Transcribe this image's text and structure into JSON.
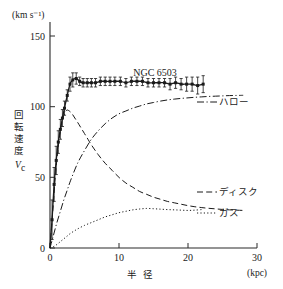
{
  "figure": {
    "name": "galaxy-rotation-curve",
    "background_color": "#ffffff",
    "ink_color": "#1a1a1a"
  },
  "labels": {
    "y_unit": "(km s⁻¹)",
    "x_unit": "(kpc)",
    "x_axis_title": "半 径",
    "y_axis_title_vertical": [
      "回",
      "転",
      "速",
      "度"
    ],
    "y_axis_symbol": "V",
    "y_axis_symbol_sub": "c",
    "object_name": "NGC 6503",
    "series_halo": "ハロー",
    "series_disk": "ディスク",
    "series_gas": "ガス"
  },
  "chart_data": {
    "type": "line",
    "title": "NGC 6503",
    "xlabel": "半 径 (kpc)",
    "ylabel": "回転速度 Vc (km s⁻¹)",
    "xlim": [
      0,
      30
    ],
    "ylim": [
      0,
      160
    ],
    "xticks": [
      0,
      10,
      20,
      30
    ],
    "yticks": [
      0,
      50,
      100,
      150
    ],
    "grid": false,
    "legend_position": "inline-right-of-curves",
    "observed": {
      "name": "observed rotation curve",
      "marker": "filled-square",
      "linestyle": "solid",
      "x": [
        0.3,
        0.6,
        0.9,
        1.2,
        1.5,
        1.8,
        2.1,
        2.5,
        2.9,
        3.3,
        3.8,
        4.3,
        4.8,
        5.4,
        6.0,
        6.6,
        7.3,
        8.0,
        8.7,
        9.4,
        10.2,
        11.0,
        11.8,
        12.6,
        13.4,
        14.2,
        15.0,
        15.8,
        16.6,
        17.4,
        18.2,
        19.0,
        19.8,
        20.6,
        21.4,
        22.2
      ],
      "y": [
        20,
        45,
        62,
        75,
        84,
        92,
        99,
        108,
        116,
        119,
        120,
        118,
        117,
        117,
        117,
        117,
        118,
        118,
        118,
        118,
        118,
        117,
        118,
        118,
        118,
        117,
        117,
        117,
        117,
        116,
        117,
        116,
        116,
        116,
        115,
        116
      ],
      "yerr": [
        14,
        12,
        10,
        8,
        7,
        6,
        5,
        4,
        5,
        5,
        4,
        3,
        3,
        3,
        3,
        3,
        3,
        3,
        3,
        3,
        3,
        3,
        3,
        3,
        3,
        3,
        3,
        3,
        3,
        4,
        4,
        4,
        5,
        5,
        6,
        6
      ]
    },
    "series": [
      {
        "name": "ハロー",
        "name_en": "halo",
        "linestyle": "dash-dot",
        "x": [
          0,
          0.5,
          1.0,
          1.5,
          2.0,
          2.5,
          3.0,
          4.0,
          5.0,
          6.0,
          7.0,
          8.0,
          9.0,
          10.0,
          11.0,
          12.0,
          13.0,
          14.0,
          15.0,
          16.0,
          17.0,
          18.0,
          19.0,
          20.0,
          21.0,
          22.0,
          23.0,
          24.0,
          25.0,
          26.0,
          27.0,
          28.0
        ],
        "y": [
          0,
          9,
          18,
          26,
          34,
          41,
          48,
          60,
          69,
          77,
          83,
          88,
          92,
          95,
          97,
          99,
          100.5,
          102,
          103,
          104,
          104.8,
          105.4,
          105.9,
          106.3,
          106.7,
          107,
          107.3,
          107.5,
          107.7,
          107.9,
          108,
          108.1
        ]
      },
      {
        "name": "ディスク",
        "name_en": "disk",
        "linestyle": "dashed",
        "x": [
          0,
          0.4,
          0.8,
          1.2,
          1.6,
          2.0,
          2.4,
          2.8,
          3.2,
          3.6,
          4.0,
          4.5,
          5.0,
          5.5,
          6.0,
          7.0,
          8.0,
          9.0,
          10.0,
          11.0,
          12.0,
          13.0,
          14.0,
          15.0,
          16.0,
          17.0,
          18.0,
          19.0,
          20.0,
          21.0,
          22.0,
          23.0,
          24.0,
          25.0,
          26.0,
          27.0,
          28.0
        ],
        "y": [
          0,
          26,
          52,
          72,
          86,
          94,
          97.5,
          97,
          95,
          92,
          89,
          85,
          81,
          77,
          73,
          66,
          60,
          55,
          50,
          46,
          43,
          40,
          38,
          36,
          34.5,
          33,
          32,
          31,
          30,
          29.2,
          28.6,
          28.1,
          27.7,
          27.3,
          27.0,
          26.8,
          26.6
        ]
      },
      {
        "name": "ガス",
        "name_en": "gas",
        "linestyle": "dotted",
        "x": [
          0,
          0.5,
          1.0,
          1.5,
          2.0,
          2.5,
          3.0,
          3.5,
          4.0,
          5.0,
          6.0,
          7.0,
          8.0,
          9.0,
          10.0,
          11.0,
          12.0,
          13.0,
          14.0,
          15.0,
          16.0,
          17.0,
          18.0,
          19.0,
          20.0,
          21.0,
          22.0
        ],
        "y": [
          0,
          1,
          2.5,
          4.5,
          6.5,
          8.5,
          10.5,
          12,
          13.5,
          16,
          18,
          20,
          22,
          23.5,
          25,
          26,
          27,
          27.6,
          28,
          27.8,
          27.5,
          27.2,
          27.0,
          26.8,
          26.6,
          26.8,
          27.2
        ]
      }
    ]
  }
}
